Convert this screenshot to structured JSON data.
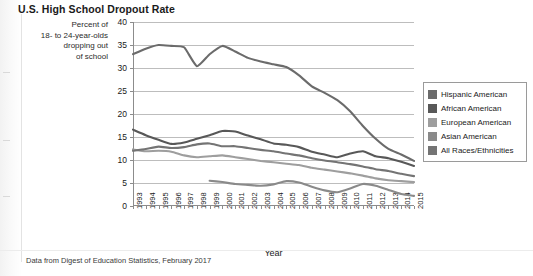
{
  "title": "U.S. High School Dropout Rate",
  "y_caption_lines": [
    "Percent of",
    "18- to 24-year-olds",
    "dropping out",
    "of school"
  ],
  "source_note": "Data from Digest of Education Statistics, February 2017",
  "legend": {
    "items": [
      {
        "label": "Hispanic American",
        "color": "#6b6b6b"
      },
      {
        "label": "African American",
        "color": "#585858"
      },
      {
        "label": "European American",
        "color": "#9e9e9e"
      },
      {
        "label": "Asian American",
        "color": "#8a8a8a"
      },
      {
        "label": "All Races/Ethnicities",
        "color": "#747474"
      }
    ]
  },
  "chart_data": {
    "type": "line",
    "title": "U.S. High School Dropout Rate",
    "subtitle": "",
    "xlabel": "Year",
    "ylabel": "Percent of 18- to 24-year-olds dropping out of school",
    "xlim": [
      1993,
      2015
    ],
    "ylim": [
      0,
      40
    ],
    "yticks": [
      0,
      5,
      10,
      15,
      20,
      25,
      30,
      35,
      40
    ],
    "grid": "horizontal",
    "legend_position": "right",
    "x": [
      1993,
      1994,
      1995,
      1996,
      1997,
      1998,
      1999,
      2000,
      2001,
      2002,
      2003,
      2004,
      2005,
      2006,
      2007,
      2008,
      2009,
      2010,
      2011,
      2012,
      2013,
      2014,
      2015
    ],
    "series": [
      {
        "name": "Hispanic American",
        "color": "#6b6b6b",
        "values": [
          33.0,
          34.2,
          35.0,
          34.8,
          34.5,
          30.4,
          33.0,
          34.8,
          33.6,
          32.2,
          31.4,
          30.8,
          30.2,
          28.4,
          26.0,
          24.6,
          23.0,
          20.6,
          17.4,
          14.6,
          12.4,
          11.2,
          9.8
        ]
      },
      {
        "name": "African American",
        "color": "#585858",
        "values": [
          16.6,
          15.4,
          14.4,
          13.5,
          13.8,
          14.6,
          15.4,
          16.3,
          16.2,
          15.3,
          14.5,
          13.6,
          13.3,
          12.8,
          11.8,
          11.2,
          10.6,
          11.4,
          11.9,
          10.8,
          10.4,
          9.6,
          8.7
        ]
      },
      {
        "name": "European American",
        "color": "#9e9e9e",
        "values": [
          12.3,
          11.9,
          12.0,
          11.8,
          11.0,
          10.6,
          10.8,
          11.0,
          10.6,
          10.2,
          9.8,
          9.5,
          9.2,
          8.9,
          8.3,
          7.9,
          7.5,
          7.1,
          6.6,
          6.0,
          5.6,
          5.4,
          5.2
        ]
      },
      {
        "name": "Asian American",
        "color": "#8a8a8a",
        "values": [
          null,
          null,
          null,
          null,
          null,
          null,
          5.5,
          5.2,
          4.8,
          4.6,
          4.4,
          4.7,
          5.4,
          5.1,
          4.2,
          3.4,
          3.0,
          3.8,
          4.8,
          4.4,
          3.5,
          2.6,
          2.2
        ]
      },
      {
        "name": "All Races/Ethnicities",
        "color": "#747474",
        "values": [
          12.0,
          12.4,
          12.9,
          12.6,
          12.8,
          13.4,
          13.6,
          13.0,
          13.0,
          12.6,
          12.2,
          11.9,
          11.4,
          11.0,
          10.4,
          9.9,
          9.5,
          9.1,
          8.6,
          8.0,
          7.6,
          7.0,
          6.5
        ]
      }
    ]
  },
  "axes": {
    "x_tick_labels": [
      "1993",
      "1994",
      "1995",
      "1996",
      "1997",
      "1998",
      "1999",
      "2000",
      "2001",
      "2002",
      "2003",
      "2004",
      "2005",
      "2006",
      "2007",
      "2008",
      "2009",
      "2010",
      "2011",
      "2012",
      "2013",
      "2014",
      "2015"
    ],
    "y_tick_labels": [
      "0",
      "5",
      "10",
      "15",
      "20",
      "25",
      "30",
      "35",
      "40"
    ],
    "x_axis_title": "Year"
  }
}
